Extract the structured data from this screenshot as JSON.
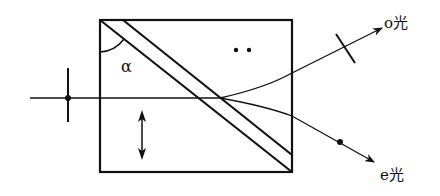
{
  "diagram": {
    "type": "optics-prism-polarizer",
    "labels": {
      "angle": "α",
      "o_ray": "o光",
      "e_ray": "e光"
    },
    "markers": {
      "optic_axis_dots": "••",
      "optic_axis_arrow": "vertical double arrow"
    },
    "colors": {
      "stroke": "#111111",
      "background": "#ffffff"
    }
  }
}
